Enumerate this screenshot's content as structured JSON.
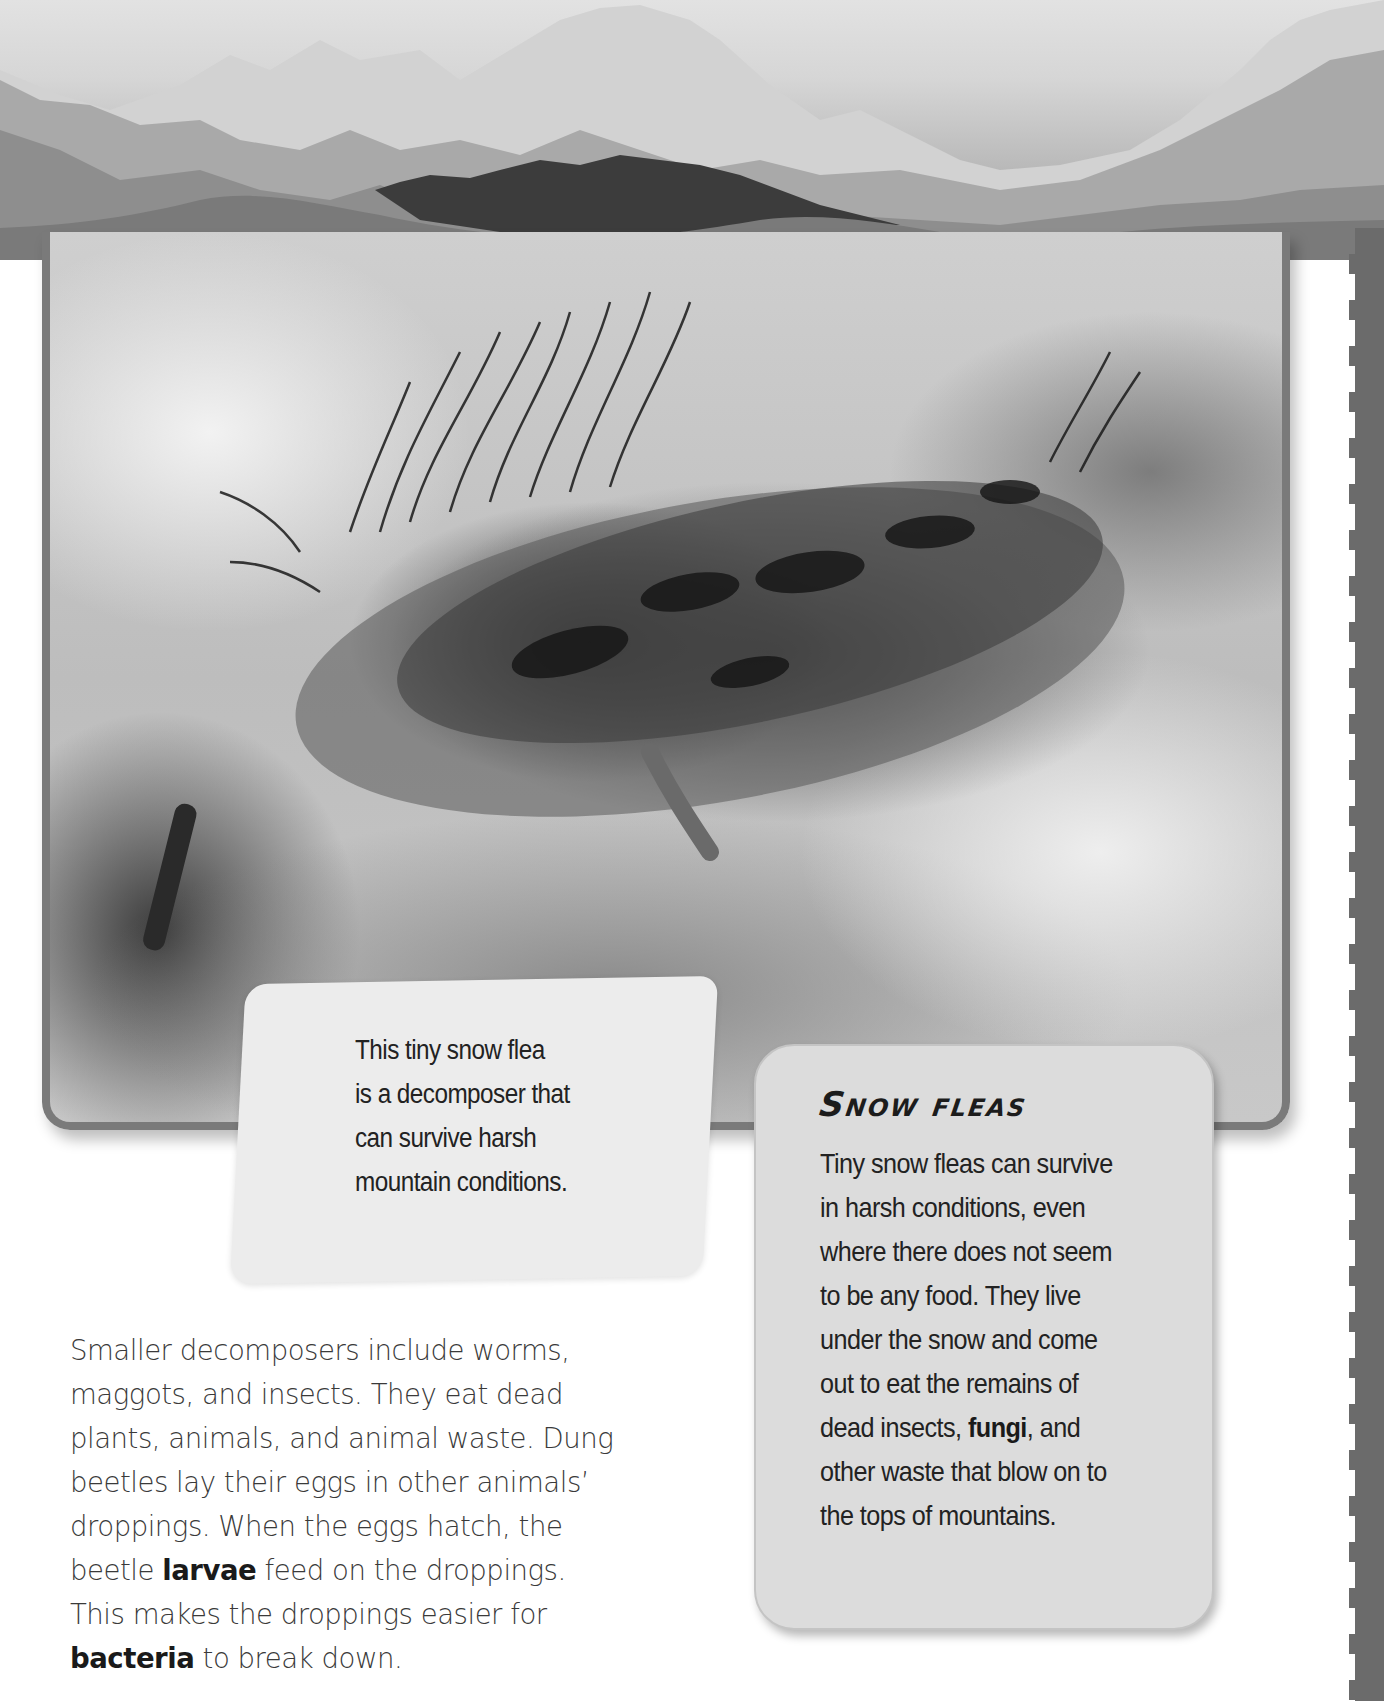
{
  "banner": {
    "icon": "mountain-range-photo"
  },
  "photo": {
    "icon": "snow-flea-photo",
    "alt": "Close-up of a hairy snow flea on rocky ground"
  },
  "caption": {
    "lines": [
      "This tiny snow flea",
      "is a decomposer that",
      "can survive harsh",
      "mountain conditions."
    ]
  },
  "fact_box": {
    "title": "Snow fleas",
    "lines": [
      {
        "text": "Tiny snow fleas can survive"
      },
      {
        "text": "in harsh conditions, even"
      },
      {
        "text": "where there does not seem"
      },
      {
        "text": "to be any food. They live"
      },
      {
        "text": "under the snow and come"
      },
      {
        "text": "out to eat the remains of"
      },
      {
        "before": "dead insects, ",
        "bold": "fungi",
        "after": ", and"
      },
      {
        "text": "other waste that blow on to"
      },
      {
        "text": "the tops of mountains."
      }
    ]
  },
  "body": {
    "lines": [
      {
        "text": "Smaller decomposers include worms,"
      },
      {
        "text": "maggots, and insects. They eat dead"
      },
      {
        "text": "plants, animals, and animal waste. Dung"
      },
      {
        "text": "beetles lay their eggs in other animals’"
      },
      {
        "text": "droppings. When the eggs hatch, the"
      },
      {
        "before": "beetle ",
        "bold": "larvae",
        "after": " feed on the droppings."
      },
      {
        "text": "This makes the droppings easier for"
      },
      {
        "before": "",
        "bold": "bacteria",
        "after": " to break down."
      }
    ]
  },
  "colors": {
    "frame_border": "#7a7a7a",
    "edge_strip": "#6b6b6b",
    "fact_box_bg": "#dcdcdc",
    "caption_bg": "#ececec",
    "text": "#222222"
  }
}
